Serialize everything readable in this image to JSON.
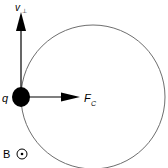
{
  "diagram": {
    "labels": {
      "velocity": "v",
      "velocity_sub": "⊥",
      "force": "F",
      "force_sub": "C",
      "charge": "q",
      "field": "B"
    },
    "colors": {
      "circle": "#6e6e6e",
      "arrows": "#000000",
      "particle": "#000000"
    },
    "geometry": {
      "circle_center": [
        93,
        97
      ],
      "circle_radius": 72,
      "particle_center": [
        21,
        97
      ],
      "particle_radius": 9
    },
    "field_symbol": "dot-in-circle (out of page)"
  }
}
